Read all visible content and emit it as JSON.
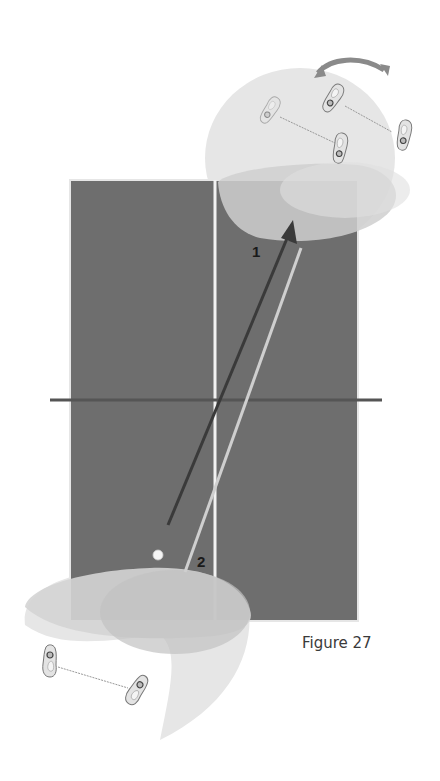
{
  "figure": {
    "caption": "Figure 27",
    "colors": {
      "table": "#6e6e6e",
      "table_border": "#e6e6e6",
      "center_line": "#f2f2f2",
      "net": "#555555",
      "zone_light": "#d9d9d9",
      "zone_mid": "#c4c4c4",
      "arrow_dark": "#3a3a3a",
      "arrow_light": "#c9c9c9",
      "ball": "#f5f5f5",
      "rotation_arrow": "#8a8a8a"
    },
    "paths": [
      {
        "id": "1",
        "label": "1",
        "description": "dark arrow to far-right corner"
      },
      {
        "id": "2",
        "label": "2",
        "description": "light return line"
      }
    ],
    "icons": {
      "rotation": "rotation-arrow-icon",
      "footprint": "footprint-icon",
      "ball": "ball-icon"
    }
  }
}
